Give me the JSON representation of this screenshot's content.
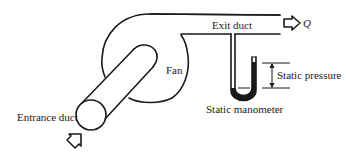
{
  "diagram": {
    "type": "fan-system-schematic",
    "labels": {
      "exit_duct": "Exit duct",
      "flow": "Q",
      "fan": "Fan",
      "static_pressure": "Static pressure",
      "static_manometer": "Static manometer",
      "entrance_duct": "Entrance duct"
    },
    "components": [
      {
        "id": "entrance-duct",
        "shape": "cylinder",
        "label": "Entrance duct"
      },
      {
        "id": "fan",
        "shape": "scroll-housing",
        "label": "Fan"
      },
      {
        "id": "exit-duct",
        "shape": "rectangular-duct",
        "label": "Exit duct"
      },
      {
        "id": "static-manometer",
        "shape": "u-tube",
        "label": "Static manometer"
      },
      {
        "id": "static-pressure",
        "shape": "dimension-arrow",
        "label": "Static pressure"
      },
      {
        "id": "inflow-arrow",
        "shape": "block-arrow",
        "direction": "up-right"
      },
      {
        "id": "outflow-arrow",
        "shape": "block-arrow",
        "direction": "right",
        "label": "Q"
      }
    ],
    "colors": {
      "line": "#1a1a1a",
      "fluid": "#1a1a1a",
      "background": "#ffffff"
    }
  }
}
